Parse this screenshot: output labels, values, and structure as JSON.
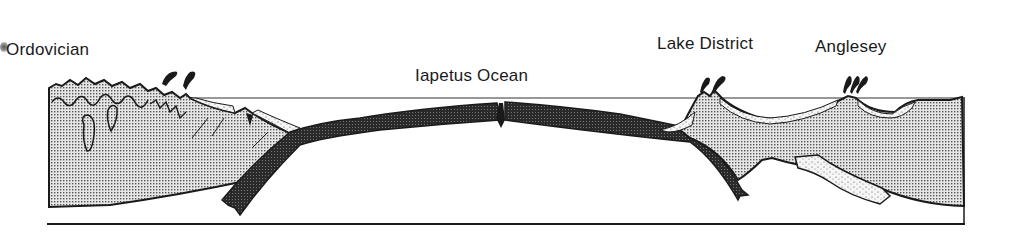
{
  "title": "Ordovician",
  "labels": {
    "ocean": "Iapetus Ocean",
    "lake_district": "Lake District",
    "anglesey": "Anglesey"
  },
  "colors": {
    "ink": "#1a1a1a",
    "crust_stipple": "#c8c8c8",
    "oceanic_plate": "#2a2a2a",
    "sediment": "#f2f2f2",
    "background": "#ffffff"
  },
  "features": [
    {
      "name": "volcano-left-1",
      "kind": "volcanic-eruption"
    },
    {
      "name": "volcano-left-2",
      "kind": "volcanic-eruption"
    },
    {
      "name": "mid-ocean-ridge",
      "kind": "spreading-ridge"
    },
    {
      "name": "lake-district-volcano",
      "kind": "volcanic-arc"
    },
    {
      "name": "anglesey-volcano",
      "kind": "volcanic-arc"
    },
    {
      "name": "left-subducting-slab",
      "kind": "oceanic-plate"
    },
    {
      "name": "right-subducting-slab",
      "kind": "oceanic-plate"
    },
    {
      "name": "anglesey-slab",
      "kind": "older-slab"
    }
  ]
}
